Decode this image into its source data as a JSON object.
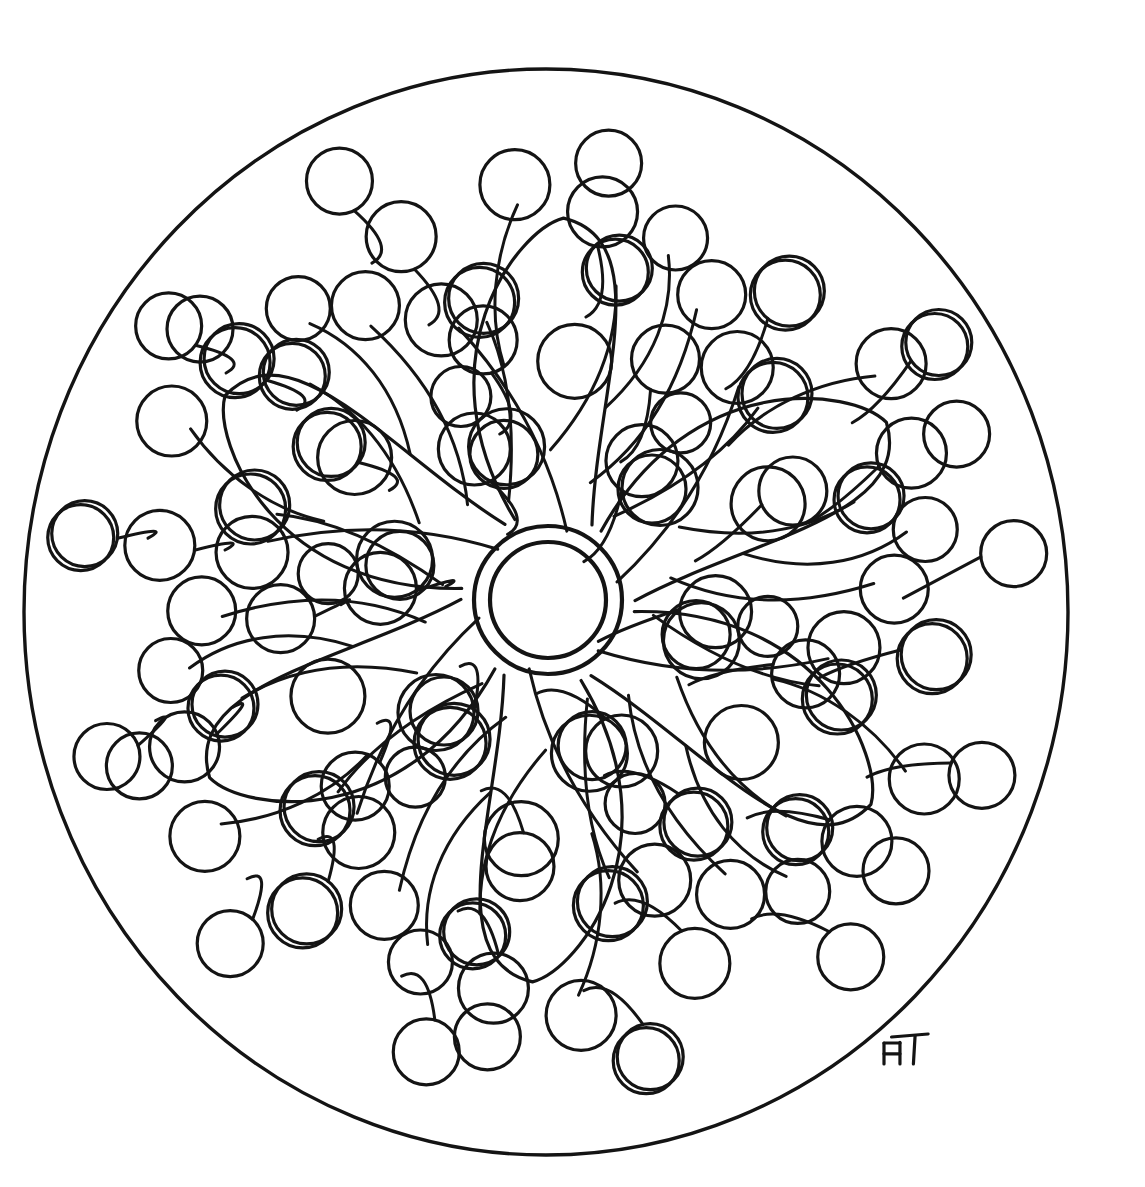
{
  "artwork": {
    "title": "Mandala coloring page",
    "subject": "floral pinwheel mandala with berry circles",
    "medium": "black ink line drawing on white paper",
    "background_color": "#ffffff",
    "ink_color": "#141414"
  },
  "canvas": {
    "width": 1145,
    "height": 1187
  },
  "border": {
    "name": "outer-boundary-circle",
    "cx": 546,
    "cy": 612,
    "rx": 522,
    "ry": 543,
    "stroke_width": 3.4
  },
  "center": {
    "name": "center-double-ring",
    "cx": 548,
    "cy": 600,
    "outer_r": 74,
    "inner_r": 58,
    "stroke_width": 4.2
  },
  "signature": {
    "name": "artist-monogram",
    "text": "AT",
    "x": 884,
    "y": 1034,
    "width": 42,
    "height": 30
  },
  "style": {
    "petal_stroke": 3.2,
    "stem_stroke": 3.0,
    "circle_stroke": 3.2,
    "double_offset_x": -4,
    "double_offset_y": 4
  },
  "petals": [
    {
      "id": "petal-n",
      "angle": -86,
      "tip": 330,
      "width": 112,
      "base": 92
    },
    {
      "id": "petal-ne",
      "angle": -26,
      "tip": 330,
      "width": 112,
      "base": 92
    },
    {
      "id": "petal-se",
      "angle": 34,
      "tip": 330,
      "width": 112,
      "base": 92
    },
    {
      "id": "petal-s",
      "angle": 94,
      "tip": 330,
      "width": 112,
      "base": 92
    },
    {
      "id": "petal-sw",
      "angle": 154,
      "tip": 330,
      "width": 112,
      "base": 92
    },
    {
      "id": "petal-nw",
      "angle": 214,
      "tip": 330,
      "width": 112,
      "base": 92
    }
  ],
  "branches": [
    {
      "id": "branch-n",
      "angle": -86
    },
    {
      "id": "branch-ne",
      "angle": -26
    },
    {
      "id": "branch-se",
      "angle": 34
    },
    {
      "id": "branch-s",
      "angle": 94
    },
    {
      "id": "branch-sw",
      "angle": 154
    },
    {
      "id": "branch-nw",
      "angle": 214
    }
  ],
  "branch_template": {
    "stems": [
      {
        "from": [
          70,
          14
        ],
        "c1": [
          150,
          -10
        ],
        "c2": [
          215,
          -55
        ],
        "to": [
          265,
          -108
        ]
      },
      {
        "from": [
          150,
          -8
        ],
        "c1": [
          200,
          30
        ],
        "c2": [
          255,
          52
        ],
        "to": [
          318,
          46
        ]
      },
      {
        "from": [
          120,
          34
        ],
        "c1": [
          168,
          92
        ],
        "c2": [
          232,
          118
        ],
        "to": [
          300,
          128
        ]
      },
      {
        "from": [
          230,
          -60
        ],
        "c1": [
          280,
          -80
        ],
        "c2": [
          340,
          -78
        ],
        "to": [
          392,
          -58
        ]
      },
      {
        "from": [
          196,
          44
        ],
        "c1": [
          244,
          90
        ],
        "c2": [
          300,
          106
        ],
        "to": [
          352,
          96
        ]
      },
      {
        "from": [
          88,
          60
        ],
        "c1": [
          120,
          120
        ],
        "c2": [
          160,
          168
        ],
        "to": [
          206,
          196
        ]
      }
    ],
    "circles": [
      {
        "cx": 272,
        "cy": -126,
        "r": 36,
        "double": false
      },
      {
        "cx": 336,
        "cy": 48,
        "r": 33,
        "double": true
      },
      {
        "cx": 316,
        "cy": 142,
        "r": 34,
        "double": false
      },
      {
        "cx": 412,
        "cy": -62,
        "r": 35,
        "double": false
      },
      {
        "cx": 370,
        "cy": 102,
        "r": 32,
        "double": false
      },
      {
        "cx": 222,
        "cy": 214,
        "r": 35,
        "double": true
      },
      {
        "cx": 150,
        "cy": -52,
        "r": 38,
        "double": false
      },
      {
        "cx": 240,
        "cy": 10,
        "r": 37,
        "double": false
      },
      {
        "cx": 118,
        "cy": 96,
        "r": 34,
        "double": false
      },
      {
        "cx": 440,
        "cy": 30,
        "r": 33,
        "double": false
      },
      {
        "cx": 186,
        "cy": 120,
        "r": 30,
        "double": false
      }
    ]
  },
  "rings": [
    {
      "id": "inner-ring",
      "radius": 168,
      "count": 6,
      "phase": 4,
      "circle_r": 36,
      "double_indices": [
        2
      ]
    },
    {
      "id": "mid-ring",
      "radius": 268,
      "count": 9,
      "phase": 16,
      "circle_r": 34,
      "double_indices": [
        1,
        5
      ]
    },
    {
      "id": "outer-ring",
      "radius": 392,
      "count": 12,
      "phase": 8,
      "circle_r": 35,
      "double_indices": [
        0,
        4,
        7,
        10
      ]
    },
    {
      "id": "rim-ring",
      "radius": 468,
      "count": 13,
      "phase": 22,
      "circle_r": 33,
      "double_indices": [
        2,
        6,
        11
      ]
    }
  ]
}
